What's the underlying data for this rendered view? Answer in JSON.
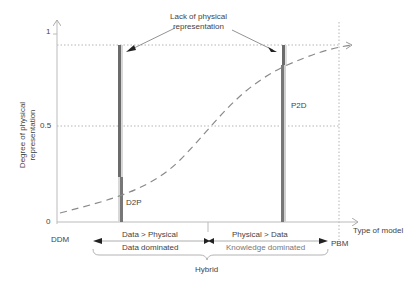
{
  "diagram": {
    "y_axis": {
      "title_line1": "Degree of physical",
      "title_line2": "representation",
      "tick_top": "1",
      "tick_mid": "0.5",
      "tick_bottom": "0"
    },
    "x_axis": {
      "title": "Type of model",
      "left_end": "DDM",
      "right_end": "PBM"
    },
    "annotation": {
      "line1": "Lack of physical",
      "line2": "representation"
    },
    "bars": {
      "left": "D2P",
      "right": "P2D"
    },
    "ranges": {
      "left_top": "Data > Physical",
      "left_bottom": "Data dominated",
      "right_top": "Physical > Data",
      "right_bottom": "Knowledge dominated",
      "brace": "Hybrid"
    },
    "colors": {
      "axis": "#bbbbbb",
      "bar_dark": "#6b6b6b",
      "bar_light": "#cfcfcf",
      "curve": "#8a8a8a",
      "text": "#444444"
    }
  }
}
